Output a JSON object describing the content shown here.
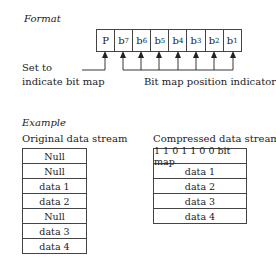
{
  "format": {
    "heading": "Format",
    "cells": [
      {
        "label": "P",
        "sub": ""
      },
      {
        "label": "b",
        "sub": "7"
      },
      {
        "label": "b",
        "sub": "6"
      },
      {
        "label": "b",
        "sub": "5"
      },
      {
        "label": "b",
        "sub": "4"
      },
      {
        "label": "b",
        "sub": "3"
      },
      {
        "label": "b",
        "sub": "2"
      },
      {
        "label": "b",
        "sub": "1"
      }
    ],
    "set_label_line1": "Set to",
    "set_label_line2": "indicate bit map",
    "position_label": "Bit map position indicators"
  },
  "example": {
    "heading": "Example",
    "original": {
      "title": "Original data stream",
      "rows": [
        "Null",
        "Null",
        "data 1",
        "data 2",
        "Null",
        "data 3",
        "data 4"
      ]
    },
    "compressed": {
      "title": "Compressed data stream",
      "rows": [
        "1 1 0 1 1 0 0 bit map",
        "data 1",
        "data 2",
        "data 3",
        "data 4"
      ]
    }
  }
}
